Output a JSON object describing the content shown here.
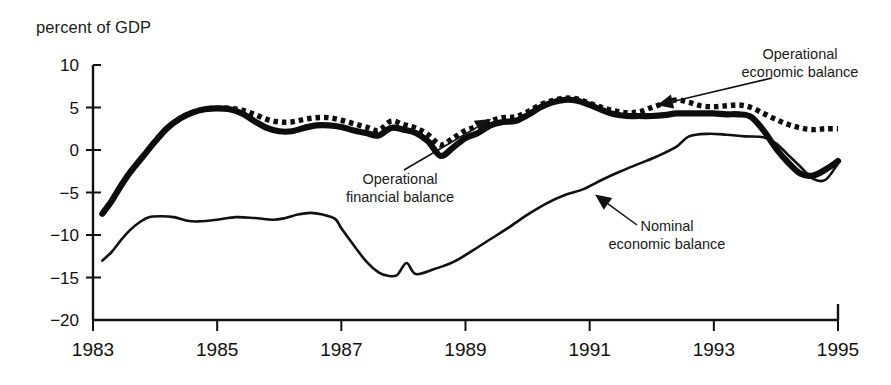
{
  "chart_data": {
    "type": "line",
    "title": "percent of GDP",
    "xlabel": "",
    "ylabel": "percent of GDP",
    "xlim": [
      1983,
      1995
    ],
    "ylim": [
      -20,
      10
    ],
    "yticks": [
      10,
      5,
      0,
      -5,
      -10,
      -15,
      -20
    ],
    "ytick_labels": [
      "10",
      "5",
      "0",
      "−5",
      "−10",
      "−15",
      "−20"
    ],
    "xticks": [
      1983,
      1985,
      1987,
      1989,
      1991,
      1993,
      1995
    ],
    "xtick_labels": [
      "1983",
      "1985",
      "1987",
      "1989",
      "1991",
      "1993",
      "1995"
    ],
    "grid": false,
    "legend_position": "inline-annotations",
    "annotations": [
      {
        "id": "operational-economic-balance",
        "text_line1": "Operational",
        "text_line2": "economic balance",
        "target_series": "Operational economic balance",
        "target_x": 1992.1,
        "target_y": 5.3
      },
      {
        "id": "operational-financial-balance",
        "text_line1": "Operational",
        "text_line2": "financial balance",
        "target_series": "Operational financial balance",
        "target_x": 1989.4,
        "target_y": 3.6
      },
      {
        "id": "nominal-economic-balance",
        "text_line1": "Nominal",
        "text_line2": "economic balance",
        "target_series": "Nominal economic balance",
        "target_x": 1991.1,
        "target_y": -5.3
      }
    ],
    "series": [
      {
        "name": "Operational financial balance",
        "style": "thick-solid",
        "color": "#0d0d0d",
        "x": [
          1983.15,
          1983.3,
          1983.45,
          1983.6,
          1983.8,
          1984.0,
          1984.2,
          1984.4,
          1984.6,
          1984.8,
          1985.0,
          1985.2,
          1985.4,
          1985.6,
          1985.8,
          1986.0,
          1986.2,
          1986.4,
          1986.6,
          1986.8,
          1987.0,
          1987.2,
          1987.4,
          1987.6,
          1987.8,
          1988.0,
          1988.2,
          1988.4,
          1988.6,
          1988.8,
          1989.0,
          1989.2,
          1989.4,
          1989.6,
          1989.8,
          1990.0,
          1990.2,
          1990.4,
          1990.6,
          1990.8,
          1991.0,
          1991.2,
          1991.4,
          1991.6,
          1991.8,
          1992.0,
          1992.2,
          1992.4,
          1992.6,
          1992.8,
          1993.0,
          1993.2,
          1993.4,
          1993.6,
          1993.8,
          1994.0,
          1994.2,
          1994.4,
          1994.6,
          1994.8,
          1995.0
        ],
        "y": [
          -7.5,
          -6.0,
          -4.2,
          -2.6,
          -0.8,
          1.0,
          2.6,
          3.7,
          4.4,
          4.8,
          4.9,
          4.8,
          4.3,
          3.4,
          2.6,
          2.2,
          2.2,
          2.6,
          2.9,
          2.9,
          2.7,
          2.3,
          2.0,
          1.7,
          2.6,
          2.4,
          2.0,
          1.0,
          -0.7,
          0.3,
          1.4,
          2.0,
          2.9,
          3.3,
          3.4,
          4.1,
          5.0,
          5.6,
          5.9,
          5.8,
          5.3,
          4.7,
          4.2,
          4.0,
          4.0,
          4.0,
          4.1,
          4.3,
          4.3,
          4.3,
          4.3,
          4.2,
          4.2,
          3.9,
          2.3,
          0.2,
          -1.5,
          -2.8,
          -3.0,
          -2.3,
          -1.3
        ]
      },
      {
        "name": "Operational economic balance",
        "style": "thick-dotted",
        "color": "#0d0d0d",
        "x": [
          1983.15,
          1983.3,
          1983.45,
          1983.6,
          1983.8,
          1984.0,
          1984.2,
          1984.4,
          1984.6,
          1984.8,
          1985.0,
          1985.2,
          1985.4,
          1985.6,
          1985.8,
          1986.0,
          1986.2,
          1986.4,
          1986.6,
          1986.8,
          1987.0,
          1987.2,
          1987.4,
          1987.6,
          1987.8,
          1988.0,
          1988.2,
          1988.4,
          1988.6,
          1988.8,
          1989.0,
          1989.2,
          1989.4,
          1989.6,
          1989.8,
          1990.0,
          1990.2,
          1990.4,
          1990.6,
          1990.8,
          1991.0,
          1991.2,
          1991.4,
          1991.6,
          1991.8,
          1992.0,
          1992.2,
          1992.4,
          1992.6,
          1992.8,
          1993.0,
          1993.2,
          1993.4,
          1993.6,
          1993.8,
          1994.0,
          1994.2,
          1994.4,
          1994.6,
          1994.8,
          1995.0
        ],
        "y": [
          -7.5,
          -6.0,
          -4.2,
          -2.6,
          -0.8,
          1.0,
          2.6,
          3.7,
          4.4,
          4.8,
          4.9,
          4.9,
          4.7,
          4.2,
          3.6,
          3.3,
          3.3,
          3.6,
          3.8,
          3.8,
          3.5,
          3.1,
          2.7,
          2.3,
          3.4,
          3.0,
          2.6,
          1.8,
          0.6,
          1.4,
          2.3,
          2.8,
          3.4,
          3.8,
          3.9,
          4.5,
          5.3,
          5.8,
          6.1,
          6.0,
          5.5,
          5.0,
          4.6,
          4.4,
          4.5,
          5.0,
          5.5,
          5.9,
          5.6,
          5.2,
          5.1,
          5.2,
          5.3,
          5.0,
          4.3,
          3.6,
          3.0,
          2.6,
          2.4,
          2.5,
          2.5
        ]
      },
      {
        "name": "Nominal economic balance",
        "style": "thin-solid",
        "color": "#111111",
        "x": [
          1983.15,
          1983.3,
          1983.45,
          1983.6,
          1983.75,
          1983.9,
          1984.1,
          1984.3,
          1984.5,
          1984.7,
          1985.0,
          1985.3,
          1985.6,
          1985.9,
          1986.1,
          1986.3,
          1986.5,
          1986.7,
          1986.9,
          1987.0,
          1987.2,
          1987.4,
          1987.6,
          1987.75,
          1987.9,
          1988.05,
          1988.2,
          1988.5,
          1988.8,
          1989.1,
          1989.4,
          1989.7,
          1990.0,
          1990.3,
          1990.6,
          1990.9,
          1991.2,
          1991.5,
          1991.8,
          1992.1,
          1992.4,
          1992.6,
          1992.9,
          1993.2,
          1993.5,
          1993.8,
          1994.0,
          1994.2,
          1994.4,
          1994.6,
          1994.8,
          1995.0
        ],
        "y": [
          -13.0,
          -12.0,
          -10.6,
          -9.4,
          -8.5,
          -7.9,
          -7.8,
          -7.9,
          -8.3,
          -8.4,
          -8.2,
          -7.9,
          -8.0,
          -8.2,
          -8.0,
          -7.6,
          -7.4,
          -7.6,
          -8.1,
          -9.2,
          -11.2,
          -13.1,
          -14.4,
          -14.8,
          -14.7,
          -13.3,
          -14.6,
          -14.0,
          -13.2,
          -11.9,
          -10.5,
          -9.1,
          -7.6,
          -6.3,
          -5.3,
          -4.6,
          -3.5,
          -2.5,
          -1.6,
          -0.7,
          0.4,
          1.6,
          1.9,
          1.8,
          1.6,
          1.5,
          0.8,
          -0.6,
          -2.0,
          -3.4,
          -3.5,
          -1.6
        ]
      }
    ]
  }
}
